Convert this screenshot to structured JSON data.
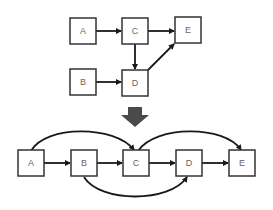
{
  "colors": {
    "node_border": "#333333",
    "node_fill": "#ffffff",
    "node_label": "#666666",
    "edge": "#1a1a1a",
    "transform_arrow": "#4a4a4a"
  },
  "top_graph": {
    "nodes": [
      {
        "id": "A",
        "label": "A"
      },
      {
        "id": "C",
        "label": "C"
      },
      {
        "id": "E",
        "label": "E"
      },
      {
        "id": "B",
        "label": "B"
      },
      {
        "id": "D",
        "label": "D"
      }
    ],
    "edges": [
      {
        "from": "A",
        "to": "C"
      },
      {
        "from": "C",
        "to": "E"
      },
      {
        "from": "C",
        "to": "D"
      },
      {
        "from": "B",
        "to": "D"
      },
      {
        "from": "D",
        "to": "E"
      }
    ]
  },
  "transform_arrow": {
    "icon": "down-arrow-icon",
    "direction": "down"
  },
  "bottom_graph": {
    "nodes": [
      {
        "id": "A",
        "label": "A"
      },
      {
        "id": "B",
        "label": "B"
      },
      {
        "id": "C",
        "label": "C"
      },
      {
        "id": "D",
        "label": "D"
      },
      {
        "id": "E",
        "label": "E"
      }
    ],
    "edges": [
      {
        "from": "A",
        "to": "B"
      },
      {
        "from": "B",
        "to": "C"
      },
      {
        "from": "C",
        "to": "D"
      },
      {
        "from": "D",
        "to": "E"
      },
      {
        "from": "A",
        "to": "C",
        "style": "arc-over"
      },
      {
        "from": "C",
        "to": "E",
        "style": "arc-over"
      },
      {
        "from": "B",
        "to": "D",
        "style": "arc-under"
      }
    ]
  }
}
